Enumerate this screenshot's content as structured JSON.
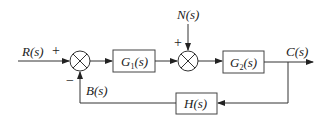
{
  "diagram": {
    "type": "closed-loop control block diagram",
    "signals": {
      "input": "R(s)",
      "disturbance": "N(s)",
      "output": "C(s)",
      "feedback": "B(s)"
    },
    "blocks": [
      {
        "id": "g1",
        "label_main": "G",
        "label_sub": "1",
        "label_tail": "(s)"
      },
      {
        "id": "g2",
        "label_main": "G",
        "label_sub": "2",
        "label_tail": "(s)"
      },
      {
        "id": "h",
        "label_main": "H(s)"
      }
    ],
    "summing_junctions": [
      {
        "id": "sum1",
        "signs": {
          "input": "+",
          "feedback": "−"
        }
      },
      {
        "id": "sum2",
        "signs": {
          "disturbance": "+"
        }
      }
    ]
  }
}
